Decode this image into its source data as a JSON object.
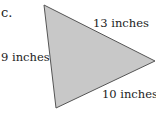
{
  "problem": {
    "label": "c.",
    "shape": "triangle",
    "fill_color": "#c8c8c8",
    "stroke_color": "#555555",
    "sides": [
      {
        "name": "left",
        "label": "9 inches"
      },
      {
        "name": "top",
        "label": "13 inches"
      },
      {
        "name": "bottom",
        "label": "10 inches"
      }
    ]
  }
}
